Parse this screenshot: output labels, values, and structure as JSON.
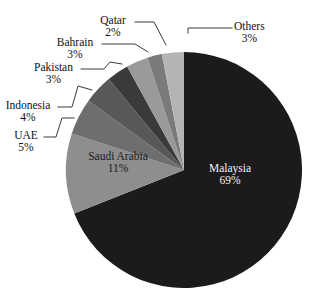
{
  "chart_data": {
    "type": "pie",
    "title": "",
    "subtitle": "",
    "xlabel": "",
    "ylabel": "",
    "legend_position": "none",
    "grid": false,
    "label_format": "category + percent",
    "start_angle_deg": 0,
    "direction": "clockwise",
    "categories": [
      "Malaysia",
      "Saudi Arabia",
      "UAE",
      "Indonesia",
      "Pakistan",
      "Bahrain",
      "Qatar",
      "Others"
    ],
    "values": [
      69,
      11,
      5,
      4,
      3,
      3,
      2,
      3
    ],
    "unit": "%",
    "slices": [
      {
        "label": "Malaysia",
        "percent_text": "69%",
        "value": 69,
        "color": "#1c1a1a",
        "label_placement": "inside",
        "label_color": "light"
      },
      {
        "label": "Saudi Arabia",
        "percent_text": "11%",
        "value": 11,
        "color": "#8e8e8e",
        "label_placement": "inside",
        "label_color": "dark"
      },
      {
        "label": "UAE",
        "percent_text": "5%",
        "value": 5,
        "color": "#6e6e6e",
        "label_placement": "callout",
        "label_color": "dark"
      },
      {
        "label": "Indonesia",
        "percent_text": "4%",
        "value": 4,
        "color": "#585858",
        "label_placement": "callout",
        "label_color": "dark"
      },
      {
        "label": "Pakistan",
        "percent_text": "3%",
        "value": 3,
        "color": "#3a3a3a",
        "label_placement": "callout",
        "label_color": "dark"
      },
      {
        "label": "Bahrain",
        "percent_text": "3%",
        "value": 3,
        "color": "#9a9a9a",
        "label_placement": "callout",
        "label_color": "dark"
      },
      {
        "label": "Qatar",
        "percent_text": "2%",
        "value": 2,
        "color": "#7a7a7a",
        "label_placement": "callout",
        "label_color": "dark"
      },
      {
        "label": "Others",
        "percent_text": "3%",
        "value": 3,
        "color": "#b4b4b4",
        "label_placement": "callout",
        "label_color": "dark"
      }
    ]
  },
  "colors": {
    "background": "#ffffff",
    "leader_line": "#3b3b3b",
    "text": "#111111",
    "text_on_dark": "#f2f2f2"
  }
}
